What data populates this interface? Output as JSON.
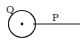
{
  "diagram": {
    "labels": {
      "circle": "Q",
      "line": "P"
    },
    "colors": {
      "stroke": "#1a1a1a",
      "background": "#ffffff"
    }
  }
}
